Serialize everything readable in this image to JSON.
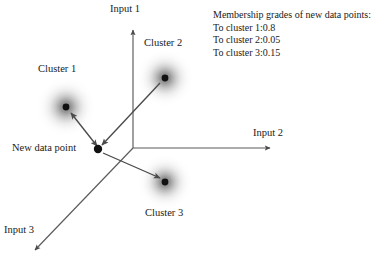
{
  "figure": {
    "type": "diagram",
    "subtype": "fuzzy-clustering-scatter-schematic",
    "background_color": "#ffffff",
    "ink_color": "#4a4a4a",
    "dot_color": "#111111",
    "blob_color": "#808080"
  },
  "axes": [
    {
      "id": "input1",
      "label": "Input 1",
      "direction": "up",
      "origin": [
        133,
        148
      ],
      "tip": [
        133,
        28
      ],
      "label_pos": [
        110,
        3
      ]
    },
    {
      "id": "input2",
      "label": "Input 2",
      "direction": "right",
      "origin": [
        133,
        148
      ],
      "tip": [
        272,
        148
      ],
      "label_pos": [
        253,
        127
      ]
    },
    {
      "id": "input3",
      "label": "Input 3",
      "direction": "down-left",
      "origin": [
        133,
        148
      ],
      "tip": [
        33,
        252
      ],
      "label_pos": [
        4,
        224
      ]
    }
  ],
  "new_data_point": {
    "label": "New data point",
    "position": [
      98,
      149
    ],
    "label_pos": [
      12,
      142
    ],
    "radius": 4.2
  },
  "clusters": [
    {
      "id": "cluster1",
      "label": "Cluster 1",
      "center": [
        66,
        107
      ],
      "blob_radius": 31,
      "dot_radius": 3.4,
      "label_pos": [
        38,
        63
      ],
      "arrow_to_point": "double"
    },
    {
      "id": "cluster2",
      "label": "Cluster 2",
      "center": [
        165,
        78
      ],
      "blob_radius": 30,
      "dot_radius": 3.4,
      "label_pos": [
        144,
        37
      ],
      "arrow_to_point": "single"
    },
    {
      "id": "cluster3",
      "label": "Cluster 3",
      "center": [
        165,
        182
      ],
      "blob_radius": 29,
      "dot_radius": 3.4,
      "label_pos": [
        145,
        207
      ],
      "arrow_to_point": "single"
    }
  ],
  "membership": {
    "pos": [
      213,
      9
    ],
    "title": "Membership grades of new data points:",
    "lines": [
      "To cluster 1:0.8",
      "To cluster 2:0.05",
      "To cluster 3:0.15"
    ]
  }
}
